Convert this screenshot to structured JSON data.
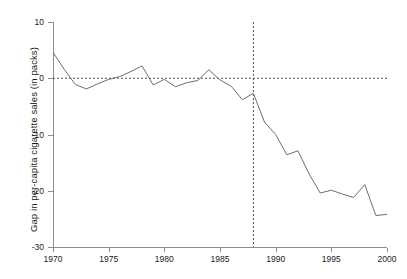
{
  "chart_data": {
    "type": "line",
    "title": "",
    "subtitle": "",
    "xlabel": "",
    "ylabel": "Gap in per-capita cigarette sales (in packs)",
    "xlim": [
      1970,
      2000
    ],
    "ylim": [
      -30,
      10
    ],
    "xticks": [
      1970,
      1975,
      1980,
      1985,
      1990,
      1995,
      2000
    ],
    "xticklabels": [
      "1970",
      "1975",
      "1980",
      "1985",
      "1990",
      "1995",
      "2000"
    ],
    "yticks": [
      10,
      0,
      -10,
      -20,
      -30
    ],
    "yticklabels": [
      "10",
      "0",
      "-10",
      "-20",
      "-30"
    ],
    "grid": false,
    "legend": "none",
    "line_color": "#6e6e6e",
    "line_width": 1.0,
    "annotations": [
      {
        "name": "zero-reference-line",
        "type": "hline",
        "value": 0,
        "style": "dashed",
        "color": "#4d4d4d"
      },
      {
        "name": "treatment-year-line",
        "type": "vline",
        "value": 1988,
        "style": "dashed",
        "color": "#4d4d4d"
      }
    ],
    "x": [
      1970,
      1971,
      1972,
      1973,
      1974,
      1975,
      1976,
      1977,
      1978,
      1979,
      1980,
      1981,
      1982,
      1983,
      1984,
      1985,
      1986,
      1987,
      1988,
      1989,
      1990,
      1991,
      1992,
      1993,
      1994,
      1995,
      1996,
      1997,
      1998,
      1999,
      2000
    ],
    "series": [
      {
        "name": "California minus synthetic California",
        "values": [
          4.6,
          1.6,
          -1.1,
          -1.9,
          -1.0,
          -0.2,
          0.3,
          1.2,
          2.2,
          -1.2,
          -0.2,
          -1.5,
          -0.8,
          -0.4,
          1.5,
          -0.3,
          -1.4,
          -3.8,
          -2.7,
          -7.8,
          -10.0,
          -13.6,
          -12.9,
          -17.0,
          -20.4,
          -19.9,
          -20.6,
          -21.2,
          -18.9,
          -24.4,
          -24.2
        ]
      }
    ]
  }
}
